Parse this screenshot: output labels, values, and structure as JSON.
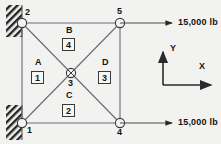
{
  "figure": {
    "kind": "truss-free-body-diagram",
    "background_color": "#f2f2f0",
    "line_color": "#55555a",
    "text_color": "#141414"
  },
  "nodes": [
    {
      "id": "1",
      "label": "1",
      "x": 22,
      "y": 123,
      "marker": "circle",
      "support": "fixed-wall"
    },
    {
      "id": "2",
      "label": "2",
      "x": 22,
      "y": 23,
      "marker": "circle",
      "support": "fixed-wall"
    },
    {
      "id": "3",
      "label": "3",
      "x": 71,
      "y": 73,
      "marker": "crossed-circle",
      "support": "none"
    },
    {
      "id": "4",
      "label": "4",
      "x": 120,
      "y": 123,
      "marker": "circle",
      "support": "none"
    },
    {
      "id": "5",
      "label": "5",
      "x": 120,
      "y": 23,
      "marker": "circle",
      "support": "none"
    }
  ],
  "regions": [
    {
      "letter": "A",
      "element": "1",
      "letter_x": 35,
      "letter_y": 63,
      "box_x": 31,
      "box_y": 75
    },
    {
      "letter": "B",
      "element": "4",
      "letter_x": 66,
      "letter_y": 31,
      "box_x": 62,
      "box_y": 42
    },
    {
      "letter": "C",
      "element": "2",
      "letter_x": 66,
      "letter_y": 96,
      "box_x": 62,
      "box_y": 108
    },
    {
      "letter": "D",
      "element": "3",
      "letter_x": 102,
      "letter_y": 63,
      "box_x": 98,
      "box_y": 75
    }
  ],
  "loads": [
    {
      "id": "load-top",
      "value": "15,000 lb",
      "arrow_y": 23,
      "arrow_x1": 142,
      "arrow_x2": 174,
      "text_x": 178,
      "text_y": 19
    },
    {
      "id": "load-bottom",
      "value": "15,000 lb",
      "arrow_y": 123,
      "arrow_x1": 142,
      "arrow_x2": 174,
      "text_x": 178,
      "text_y": 119
    }
  ],
  "axes": {
    "origin_x": 163,
    "origin_y": 85,
    "y_label": "Y",
    "y_label_x": 170,
    "y_label_y": 47,
    "y_tip_y": 50,
    "x_label": "X",
    "x_label_x": 201,
    "x_label_y": 66,
    "x_tip_x": 213
  },
  "supports": [
    {
      "id": "support-top",
      "edge_x": 22,
      "y_top": 5,
      "y_bottom": 37,
      "hatch": "diagonal"
    },
    {
      "id": "support-bottom",
      "edge_x": 22,
      "y_top": 105,
      "y_bottom": 140,
      "hatch": "diagonal"
    }
  ],
  "members": [
    {
      "id": "member-2-5",
      "from": "2",
      "to": "5"
    },
    {
      "id": "member-1-4",
      "from": "1",
      "to": "4"
    },
    {
      "id": "member-2-1",
      "from": "2",
      "to": "1"
    },
    {
      "id": "member-5-4",
      "from": "5",
      "to": "4"
    },
    {
      "id": "member-2-4",
      "from": "2",
      "to": "4"
    },
    {
      "id": "member-1-5",
      "from": "1",
      "to": "5"
    }
  ]
}
